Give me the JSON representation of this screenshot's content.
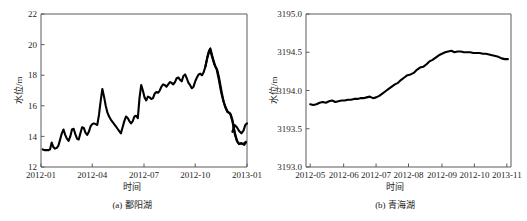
{
  "figure": {
    "background": "#ffffff",
    "line_color": "#000000",
    "axis_color": "#5a5a5a"
  },
  "panels": [
    {
      "id": "panel-a",
      "caption": "(a) 鄱阳湖",
      "chart_data": {
        "type": "line",
        "title": "",
        "xlabel": "时间",
        "ylabel": "水位/m",
        "ylim": [
          12,
          22
        ],
        "yticks": [
          12,
          14,
          16,
          18,
          20,
          22
        ],
        "ytick_labels": [
          "12",
          "14",
          "16",
          "18",
          "20",
          "22"
        ],
        "xlim": [
          0,
          366
        ],
        "xticks": [
          0,
          91,
          183,
          274,
          366
        ],
        "xtick_labels": [
          "2012-01",
          "2012-04",
          "2012-07",
          "2012-10",
          "2013-01"
        ],
        "grid": false,
        "legend": "none",
        "series": [
          {
            "name": "鄱阳湖水位",
            "x": [
              3,
              7,
              10,
              13,
              16,
              19,
              22,
              25,
              28,
              31,
              34,
              37,
              40,
              43,
              46,
              49,
              52,
              55,
              58,
              61,
              64,
              67,
              70,
              73,
              76,
              79,
              82,
              85,
              88,
              91,
              94,
              97,
              100,
              103,
              106,
              109,
              112,
              115,
              118,
              121,
              124,
              127,
              130,
              133,
              136,
              139,
              142,
              145,
              148,
              151,
              154,
              157,
              160,
              163,
              166,
              169,
              172,
              175,
              178,
              181,
              184,
              187,
              190,
              193,
              196,
              199,
              202,
              205,
              208,
              211,
              214,
              217,
              220,
              223,
              226,
              229,
              232,
              235,
              238,
              241,
              244,
              247,
              250,
              253,
              256,
              259,
              262,
              265,
              268,
              271,
              274,
              277,
              280,
              283,
              286,
              289,
              292,
              295,
              298,
              301,
              304,
              307,
              310,
              313,
              316,
              319,
              322,
              325,
              328,
              331,
              334,
              337,
              340,
              343,
              346,
              349,
              352,
              355,
              358,
              361,
              364
            ],
            "y": [
              13.15,
              13.1,
              13.1,
              13.1,
              13.15,
              13.6,
              13.3,
              13.2,
              13.25,
              13.4,
              13.8,
              14.2,
              14.45,
              14.1,
              13.85,
              13.7,
              14.0,
              14.45,
              14.5,
              14.15,
              13.85,
              13.8,
              14.2,
              14.6,
              14.55,
              14.25,
              14.1,
              14.3,
              14.65,
              14.8,
              14.85,
              14.8,
              14.75,
              15.4,
              16.3,
              17.1,
              16.6,
              16.0,
              15.55,
              15.3,
              15.1,
              14.95,
              14.8,
              14.65,
              14.5,
              14.35,
              14.2,
              14.6,
              15.0,
              15.3,
              15.2,
              15.0,
              14.85,
              15.0,
              15.3,
              15.35,
              15.2,
              16.5,
              17.35,
              17.0,
              16.55,
              16.35,
              16.6,
              16.55,
              16.45,
              16.5,
              16.8,
              16.9,
              16.85,
              17.0,
              17.25,
              17.4,
              17.35,
              17.25,
              17.4,
              17.55,
              17.5,
              17.4,
              17.55,
              17.8,
              17.85,
              17.7,
              17.6,
              17.95,
              18.05,
              17.8,
              17.5,
              17.35,
              17.15,
              17.25,
              17.6,
              17.85,
              18.05,
              18.1,
              18.0,
              18.2,
              18.55,
              19.1,
              19.55,
              19.75,
              19.3,
              18.9,
              18.55,
              18.35,
              17.9,
              17.3,
              16.7,
              16.2,
              15.85,
              15.6,
              15.55,
              15.45,
              15.1,
              14.5,
              14.0,
              13.65,
              13.5,
              13.55,
              13.5,
              13.45,
              13.6,
              13.7
            ]
          },
          {
            "name": "鄱阳湖水位(续)",
            "x": [
              292,
              296,
              300,
              304,
              308,
              312,
              316,
              320,
              324,
              328,
              332,
              336,
              340,
              344,
              348,
              352,
              356,
              360,
              364
            ],
            "y": [
              18.55,
              19.2,
              19.7,
              19.2,
              18.7,
              18.4,
              17.7,
              16.9,
              16.3,
              15.9,
              15.6,
              15.5,
              15.0,
              14.2,
              13.7,
              13.5,
              13.55,
              13.5,
              13.65
            ]
          }
        ],
        "tail_points": {
          "x": [
            340,
            344,
            348,
            352,
            356,
            360,
            363,
            366
          ],
          "y": [
            14.3,
            14.75,
            14.6,
            14.35,
            14.2,
            14.4,
            14.75,
            14.85
          ]
        }
      }
    },
    {
      "id": "panel-b",
      "caption": "(b) 青海湖",
      "chart_data": {
        "type": "line",
        "title": "",
        "xlabel": "时间",
        "ylabel": "水位/m",
        "ylim": [
          3193.0,
          3195.0
        ],
        "yticks": [
          3193.0,
          3193.5,
          3194.0,
          3194.5,
          3195.0
        ],
        "ytick_labels": [
          "3193.0",
          "3193.5",
          "3194.0",
          "3194.5",
          "3195.0"
        ],
        "xlim": [
          0,
          196
        ],
        "xticks": [
          4,
          36,
          67,
          98,
          130,
          161,
          192
        ],
        "xtick_labels": [
          "2012-05",
          "2012-06",
          "2012-07",
          "2012-08",
          "2012-09",
          "2012-10",
          "2013-11"
        ],
        "grid": false,
        "legend": "none",
        "series": [
          {
            "name": "青海湖水位",
            "x": [
              4,
              7,
              10,
              13,
              16,
              19,
              22,
              25,
              28,
              31,
              34,
              37,
              40,
              43,
              46,
              49,
              52,
              55,
              58,
              61,
              64,
              67,
              70,
              73,
              76,
              79,
              82,
              85,
              88,
              91,
              94,
              97,
              100,
              103,
              106,
              109,
              112,
              115,
              118,
              121,
              124,
              127,
              130,
              133,
              136,
              139,
              142,
              145,
              148,
              151,
              154,
              157,
              160,
              163,
              166,
              169,
              172,
              175,
              178,
              181,
              184,
              187,
              190,
              193
            ],
            "y": [
              3193.82,
              3193.81,
              3193.82,
              3193.84,
              3193.85,
              3193.84,
              3193.86,
              3193.87,
              3193.85,
              3193.86,
              3193.87,
              3193.87,
              3193.88,
              3193.88,
              3193.89,
              3193.89,
              3193.9,
              3193.9,
              3193.91,
              3193.92,
              3193.9,
              3193.91,
              3193.93,
              3193.96,
              3193.99,
              3194.02,
              3194.05,
              3194.08,
              3194.1,
              3194.14,
              3194.17,
              3194.2,
              3194.21,
              3194.23,
              3194.27,
              3194.3,
              3194.31,
              3194.34,
              3194.38,
              3194.4,
              3194.43,
              3194.46,
              3194.48,
              3194.5,
              3194.51,
              3194.52,
              3194.5,
              3194.51,
              3194.51,
              3194.5,
              3194.5,
              3194.5,
              3194.49,
              3194.49,
              3194.49,
              3194.48,
              3194.48,
              3194.47,
              3194.46,
              3194.45,
              3194.44,
              3194.42,
              3194.41,
              3194.41
            ]
          }
        ]
      }
    }
  ]
}
